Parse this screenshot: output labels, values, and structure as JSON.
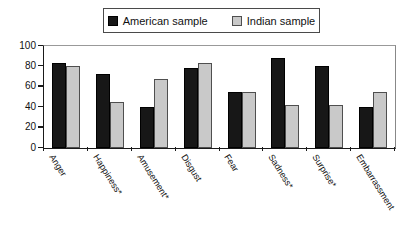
{
  "legend": {
    "border_color": "#4a4a4a"
  },
  "chart_data": {
    "type": "bar",
    "title": "",
    "xlabel": "",
    "ylabel": "",
    "categories": [
      "Anger",
      "Happiness*",
      "Amusement*",
      "Disgust",
      "Fear",
      "Sadness*",
      "Surprise*",
      "Embarrassment"
    ],
    "series": [
      {
        "name": "American sample",
        "color": "#171717",
        "border_color": "#000000",
        "values": [
          83,
          73,
          40,
          78,
          55,
          88,
          80,
          40
        ]
      },
      {
        "name": "Indian sample",
        "color": "#c9c9c9",
        "border_color": "#4f4f4f",
        "values": [
          80,
          45,
          68,
          83,
          55,
          42,
          42,
          55
        ]
      }
    ],
    "ylim": [
      0,
      100
    ],
    "yticks": [
      0,
      20,
      40,
      60,
      80,
      100
    ],
    "grid": false,
    "legend_position": "top-center",
    "x_tick_label_rotation_deg": 58
  }
}
